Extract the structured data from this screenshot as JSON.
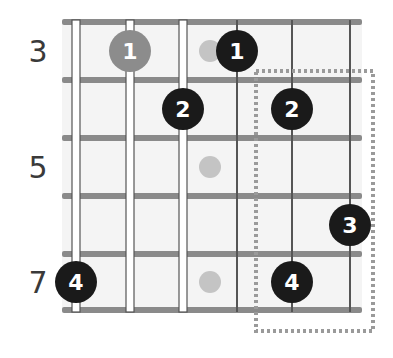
{
  "diagram": {
    "type": "guitar-scale-fretboard",
    "strings": 6,
    "fret_range": [
      3,
      7
    ],
    "fret_labels": [
      {
        "label": "3",
        "fret": 3
      },
      {
        "label": "5",
        "fret": 5
      },
      {
        "label": "7",
        "fret": 7
      }
    ],
    "inlay_markers": [
      {
        "fret": 3,
        "between_strings": [
          3,
          4
        ]
      },
      {
        "fret": 5,
        "between_strings": [
          3,
          4
        ]
      },
      {
        "fret": 7,
        "between_strings": [
          3,
          4
        ]
      }
    ],
    "notes": [
      {
        "string": 2,
        "fret": 3,
        "finger": "1",
        "style": "gray"
      },
      {
        "string": 4,
        "fret": 3,
        "finger": "1",
        "style": "black"
      },
      {
        "string": 3,
        "fret": 4,
        "finger": "2",
        "style": "black"
      },
      {
        "string": 5,
        "fret": 4,
        "finger": "2",
        "style": "black"
      },
      {
        "string": 6,
        "fret": 6,
        "finger": "3",
        "style": "black"
      },
      {
        "string": 1,
        "fret": 7,
        "finger": "4",
        "style": "black"
      },
      {
        "string": 5,
        "fret": 7,
        "finger": "4",
        "style": "black"
      }
    ],
    "highlight_box": {
      "style": "dotted",
      "from_fret": 4,
      "to_fret": 7,
      "strings": [
        5,
        6
      ]
    },
    "colors": {
      "fret": "#8a8a8a",
      "string": "#555555",
      "note_black": "#1a1a1a",
      "note_gray": "#8c8c8c",
      "inlay": "#c4c4c4",
      "box": "#9a9a9a",
      "background": "#f4f4f4"
    }
  }
}
